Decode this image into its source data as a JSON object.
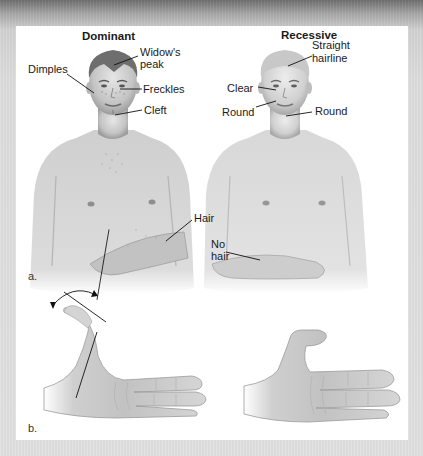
{
  "figure": {
    "panel_a": {
      "letter": "a.",
      "dominant": {
        "heading": "Dominant",
        "labels": {
          "widows_peak_line1": "Widow's",
          "widows_peak_line2": "peak",
          "dimples": "Dimples",
          "freckles": "Freckles",
          "cleft": "Cleft",
          "hair": "Hair"
        }
      },
      "recessive": {
        "heading": "Recessive",
        "labels": {
          "straight_hairline_line1": "Straight",
          "straight_hairline_line2": "hairline",
          "clear": "Clear",
          "round_cheek": "Round",
          "round_chin": "Round",
          "no_hair_line1": "No",
          "no_hair_line2": "hair"
        }
      }
    },
    "panel_b": {
      "letter": "b."
    }
  },
  "colors": {
    "frame_top": "#6f6f6f",
    "frame": "#e0e0e0",
    "panel": "#ffffff",
    "skin_light": "#e4e4e4",
    "skin_mid": "#c9c9c9",
    "skin_dark": "#9a9a9a",
    "hair_dark": "#6e6e6e",
    "hair_light": "#c8c8c8",
    "leader_line": "#111111"
  }
}
